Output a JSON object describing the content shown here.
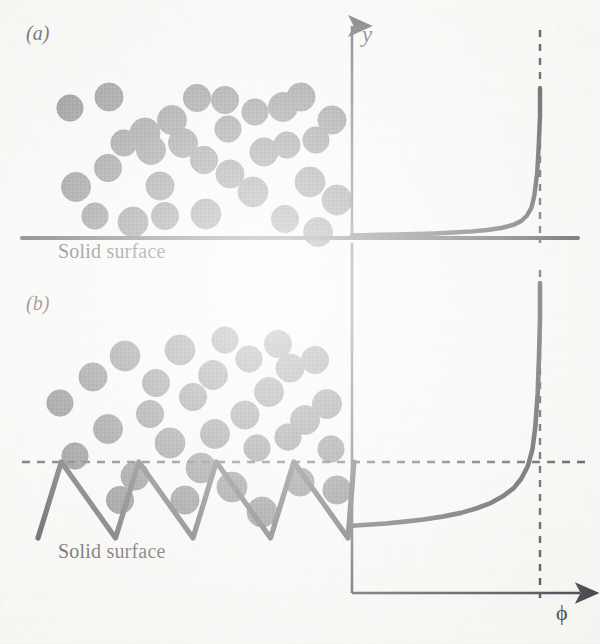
{
  "figure": {
    "kind": "two-panel schematic with concentration profiles",
    "background_color": "#f6f5f1",
    "ink_color": "#16151a",
    "particle_color": "#4a4a4a"
  },
  "panels": [
    {
      "id": "a",
      "label": "(a)",
      "surface_label": "Solid surface",
      "surface_type": "smooth"
    },
    {
      "id": "b",
      "label": "(b)",
      "surface_label": "Solid surface",
      "surface_type": "sawtooth"
    }
  ],
  "axes": {
    "y_label": "y",
    "x_label": "ϕ"
  },
  "chart_data": [
    {
      "type": "line",
      "title": "",
      "panel": "a",
      "xlabel": "ϕ",
      "ylabel": "y",
      "grid": false,
      "legend": null,
      "xlim": [
        0,
        1.18
      ],
      "ylim": [
        0,
        1.0
      ],
      "annotations": [
        {
          "type": "vline",
          "style": "dashed",
          "x": 1.0,
          "label": "ϕmax"
        }
      ],
      "comment": "particle volume-fraction profile near a smooth wall: flat at ~0 then diverges to maximum packing at the wall",
      "x": [
        0.0,
        0.06,
        0.14,
        0.24,
        0.34,
        0.44,
        0.54,
        0.64,
        0.72,
        0.8,
        0.86,
        0.9,
        0.93,
        0.955,
        0.97,
        0.985,
        0.993,
        1.0,
        1.0
      ],
      "y": [
        0.005,
        0.006,
        0.008,
        0.01,
        0.013,
        0.017,
        0.023,
        0.031,
        0.04,
        0.055,
        0.075,
        0.1,
        0.135,
        0.19,
        0.27,
        0.42,
        0.6,
        0.8,
        0.985
      ]
    },
    {
      "type": "line",
      "title": "",
      "panel": "b",
      "xlabel": "ϕ",
      "ylabel": "y",
      "grid": false,
      "legend": null,
      "xlim": [
        0,
        1.18
      ],
      "ylim": [
        0,
        1.0
      ],
      "annotations": [
        {
          "type": "vline",
          "style": "dashed",
          "x": 1.0,
          "label": "ϕmax"
        },
        {
          "type": "hline",
          "style": "dashed",
          "y": 0.62,
          "label": "roughness peak level"
        }
      ],
      "comment": "profile near a rough sawtooth wall: finite plateau inside the grooves, then diverges to maximum packing at the peak level",
      "x": [
        0.0,
        0.08,
        0.18,
        0.28,
        0.38,
        0.48,
        0.58,
        0.66,
        0.74,
        0.8,
        0.86,
        0.9,
        0.935,
        0.96,
        0.975,
        0.988,
        0.995,
        1.0,
        1.0
      ],
      "y": [
        0.215,
        0.218,
        0.222,
        0.228,
        0.235,
        0.244,
        0.256,
        0.27,
        0.288,
        0.308,
        0.335,
        0.365,
        0.405,
        0.46,
        0.53,
        0.64,
        0.76,
        0.88,
        0.99
      ]
    }
  ],
  "geometry": {
    "panel_a": {
      "surface_line_y": 238,
      "surface_x0": 22,
      "surface_x1": 578,
      "axis_x": 352,
      "phi_max_x": 540,
      "curve_top_y": 86
    },
    "panel_b": {
      "peak_level_y": 462,
      "trough_level_y": 528,
      "sawtooth_x0": 38,
      "sawtooth_x1": 348,
      "peaks": 4,
      "axis_x": 352,
      "x_axis_y": 593,
      "phi_max_x": 540,
      "curve_top_y": 280,
      "plateau_y": 513
    }
  },
  "particles_a": [
    [
      70,
      108
    ],
    [
      109,
      97
    ],
    [
      145,
      133
    ],
    [
      108,
      168
    ],
    [
      76,
      187
    ],
    [
      95,
      216
    ],
    [
      160,
      186
    ],
    [
      133,
      222
    ],
    [
      197,
      98
    ],
    [
      183,
      143
    ],
    [
      228,
      129
    ],
    [
      230,
      174
    ],
    [
      206,
      214
    ],
    [
      165,
      216
    ],
    [
      151,
      150
    ],
    [
      255,
      112
    ],
    [
      264,
      152
    ],
    [
      253,
      192
    ],
    [
      225,
      100
    ],
    [
      283,
      107
    ],
    [
      287,
      145
    ],
    [
      301,
      97
    ],
    [
      310,
      182
    ],
    [
      285,
      219
    ],
    [
      318,
      232
    ],
    [
      316,
      140
    ],
    [
      332,
      120
    ],
    [
      337,
      200
    ],
    [
      204,
      160
    ],
    [
      172,
      120
    ],
    [
      124,
      143
    ]
  ],
  "particles_b": [
    [
      60,
      403
    ],
    [
      93,
      377
    ],
    [
      125,
      356
    ],
    [
      156,
      383
    ],
    [
      108,
      429
    ],
    [
      75,
      456
    ],
    [
      135,
      476
    ],
    [
      180,
      350
    ],
    [
      193,
      397
    ],
    [
      215,
      434
    ],
    [
      249,
      359
    ],
    [
      245,
      415
    ],
    [
      201,
      468
    ],
    [
      278,
      344
    ],
    [
      269,
      392
    ],
    [
      288,
      437
    ],
    [
      300,
      482
    ],
    [
      232,
      487
    ],
    [
      315,
      360
    ],
    [
      327,
      404
    ],
    [
      331,
      449
    ],
    [
      337,
      490
    ],
    [
      170,
      443
    ],
    [
      150,
      414
    ],
    [
      213,
      375
    ],
    [
      257,
      448
    ],
    [
      185,
      500
    ],
    [
      262,
      512
    ],
    [
      120,
      500
    ],
    [
      305,
      420
    ],
    [
      225,
      340
    ],
    [
      290,
      368
    ]
  ]
}
